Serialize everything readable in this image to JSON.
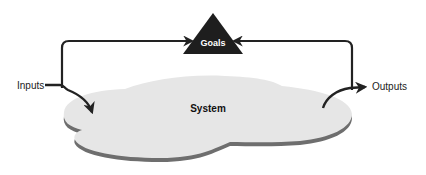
{
  "diagram": {
    "nodes": {
      "goals": {
        "label": "Goals",
        "shape": "triangle",
        "fill": "#1e1e1e",
        "text_color": "#ffffff"
      },
      "system": {
        "label": "System",
        "shape": "cloud-platform",
        "fill": "#e6e6e6",
        "edge_color": "#6e6e6e"
      },
      "inputs": {
        "label": "Inputs"
      },
      "outputs": {
        "label": "Outputs"
      }
    },
    "edges": [
      {
        "from": "inputs",
        "to": "system",
        "icon": "arrow-right-icon"
      },
      {
        "from": "inputs",
        "to": "goals",
        "icon": "arrow-right-icon"
      },
      {
        "from": "outputs",
        "to": "goals",
        "icon": "arrow-left-icon"
      },
      {
        "from": "system",
        "to": "outputs",
        "icon": "arrow-right-icon"
      }
    ],
    "line_color": "#222222"
  }
}
